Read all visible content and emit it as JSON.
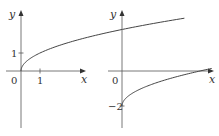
{
  "chart_data": [
    {
      "type": "line",
      "title": "",
      "xlabel": "x",
      "ylabel": "y",
      "function": "y = sqrt(x)",
      "x": [
        0,
        0.25,
        0.5,
        1,
        2,
        3,
        4,
        5,
        6,
        7,
        8,
        9
      ],
      "y": [
        0,
        0.5,
        0.707,
        1,
        1.414,
        1.732,
        2,
        2.236,
        2.449,
        2.646,
        2.828,
        3
      ],
      "xlim": [
        -0.3,
        3.3
      ],
      "ylim": [
        -4,
        1.5
      ],
      "x_ticks": [
        {
          "value": 1,
          "label": "1"
        }
      ],
      "y_ticks": [
        {
          "value": 1,
          "label": "1"
        }
      ],
      "origin_label": "0",
      "grid": false
    },
    {
      "type": "line",
      "title": "",
      "xlabel": "x",
      "ylabel": "y",
      "function": "y = sqrt(x) - 2",
      "x": [
        0,
        0.25,
        0.5,
        1,
        2,
        3,
        4,
        5
      ],
      "y": [
        -2,
        -1.5,
        -1.293,
        -1,
        -0.586,
        -0.268,
        0,
        0.236
      ],
      "xlim": [
        -0.3,
        5
      ],
      "ylim": [
        -3,
        2
      ],
      "x_ticks": [],
      "y_ticks": [
        {
          "value": -2,
          "label": "-2"
        }
      ],
      "origin_label": "0",
      "grid": false
    }
  ]
}
